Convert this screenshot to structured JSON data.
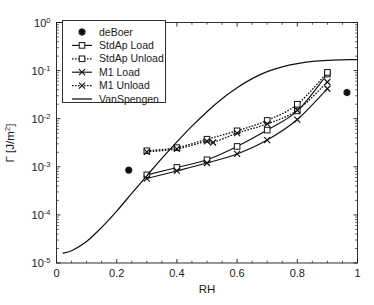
{
  "chart_data": {
    "type": "line",
    "title": "",
    "xlabel": "RH",
    "ylabel": "Γ [J/m2]",
    "ylabel_display": "Γ [J/m²]",
    "yscale": "log",
    "xscale": "linear",
    "xlim": [
      0,
      1
    ],
    "ylim": [
      1e-05,
      1
    ],
    "xticks": [
      0,
      0.2,
      0.4,
      0.6,
      0.8,
      1
    ],
    "xticklabels": [
      "0",
      "0.2",
      "0.4",
      "0.6",
      "0.8",
      "1"
    ],
    "yticks": [
      1e-05,
      0.0001,
      0.001,
      0.01,
      0.1,
      1
    ],
    "yticklabels": [
      "10-5",
      "10-4",
      "10-3",
      "10-2",
      "10-1",
      "100"
    ],
    "ytick_mantissa": "10",
    "ytick_exponents": [
      "-5",
      "-4",
      "-3",
      "-2",
      "-1",
      "0"
    ],
    "grid": false,
    "legend_position": "upper-left",
    "series": [
      {
        "name": "deBoer",
        "marker": "star",
        "linestyle": "none",
        "x": [
          0.24,
          0.965
        ],
        "y": [
          0.00085,
          0.035
        ]
      },
      {
        "name": "StdAp Load",
        "marker": "square",
        "linestyle": "solid",
        "x": [
          0.3,
          0.4,
          0.5,
          0.6,
          0.7,
          0.8,
          0.9
        ],
        "y": [
          0.00068,
          0.00097,
          0.0014,
          0.00265,
          0.0058,
          0.0145,
          0.085
        ]
      },
      {
        "name": "StdAp Unload",
        "marker": "square",
        "linestyle": "dotted",
        "x": [
          0.3,
          0.4,
          0.5,
          0.6,
          0.7,
          0.8,
          0.9
        ],
        "y": [
          0.00215,
          0.0025,
          0.00375,
          0.0056,
          0.0092,
          0.02,
          0.092
        ]
      },
      {
        "name": "M1 Load",
        "marker": "x",
        "linestyle": "solid",
        "x": [
          0.3,
          0.4,
          0.5,
          0.6,
          0.7,
          0.8,
          0.9
        ],
        "y": [
          0.00057,
          0.00082,
          0.0012,
          0.00185,
          0.0036,
          0.0096,
          0.042
        ]
      },
      {
        "name": "M1 Unload",
        "marker": "x",
        "linestyle": "dotted",
        "x": [
          0.3,
          0.4,
          0.5,
          0.52,
          0.6,
          0.7,
          0.8,
          0.9
        ],
        "y": [
          0.00205,
          0.00235,
          0.0034,
          0.0032,
          0.005,
          0.0078,
          0.015,
          0.058
        ]
      },
      {
        "name": "VanSpengen",
        "marker": "none",
        "linestyle": "solid-plain",
        "x": [
          0.02,
          0.05,
          0.1,
          0.15,
          0.2,
          0.25,
          0.3,
          0.35,
          0.4,
          0.45,
          0.5,
          0.55,
          0.6,
          0.65,
          0.7,
          0.75,
          0.8,
          0.85,
          0.9,
          0.95,
          1.0
        ],
        "y": [
          1.6e-05,
          1.8e-05,
          2.8e-05,
          5.5e-05,
          0.00012,
          0.00028,
          0.00065,
          0.0015,
          0.0033,
          0.007,
          0.014,
          0.026,
          0.044,
          0.068,
          0.095,
          0.12,
          0.14,
          0.155,
          0.164,
          0.168,
          0.17
        ]
      }
    ],
    "legend_entries": [
      {
        "label": "deBoer",
        "marker": "star",
        "linestyle": "none"
      },
      {
        "label": "StdAp Load",
        "marker": "square",
        "linestyle": "solid"
      },
      {
        "label": "StdAp Unload",
        "marker": "square",
        "linestyle": "dotted"
      },
      {
        "label": "M1 Load",
        "marker": "x",
        "linestyle": "solid"
      },
      {
        "label": "M1 Unload",
        "marker": "x",
        "linestyle": "dotted"
      },
      {
        "label": "VanSpengen",
        "marker": "none",
        "linestyle": "solid-plain"
      }
    ]
  },
  "colors": {
    "foreground": "#111111",
    "background": "#ffffff",
    "axis": "#1a1a1a"
  }
}
